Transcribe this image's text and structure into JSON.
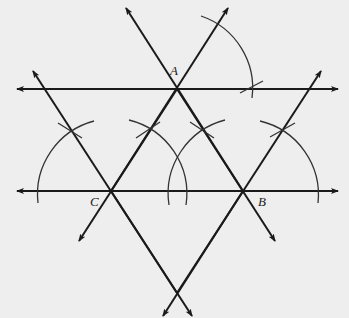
{
  "diagram": {
    "title": "",
    "background": "#eeeeee",
    "stroke_color": "#1a1a1a",
    "points": {
      "A": {
        "label": "A",
        "x": 177,
        "y": 89
      },
      "B": {
        "label": "B",
        "x": 243,
        "y": 191
      },
      "C": {
        "label": "C",
        "x": 111,
        "y": 191
      }
    },
    "labels": {
      "A": "A",
      "B": "B",
      "C": "C"
    }
  }
}
